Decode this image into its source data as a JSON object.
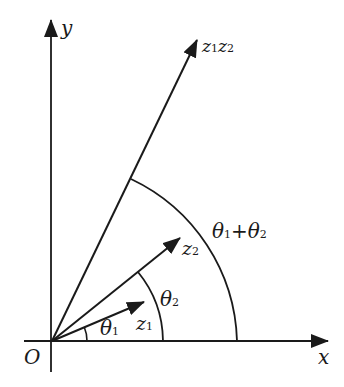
{
  "diagram": {
    "type": "complex-number-multiplication-vectors",
    "axes": {
      "x_label": "x",
      "y_label": "y",
      "origin_label": "O"
    },
    "vectors": [
      {
        "id": "z1",
        "label": "z",
        "sub": "1"
      },
      {
        "id": "z2",
        "label": "z",
        "sub": "2"
      },
      {
        "id": "z1z2",
        "label_a": "z",
        "sub_a": "1",
        "label_b": "z",
        "sub_b": "2"
      }
    ],
    "angles": [
      {
        "id": "theta1",
        "label": "θ",
        "sub": "1"
      },
      {
        "id": "theta2",
        "label": "θ",
        "sub": "2"
      },
      {
        "id": "theta_sum",
        "label_a": "θ",
        "sub_a": "1",
        "op": "+",
        "label_b": "θ",
        "sub_b": "2"
      }
    ],
    "colors": {
      "ink": "#1a1a1a",
      "background": "#ffffff"
    }
  }
}
